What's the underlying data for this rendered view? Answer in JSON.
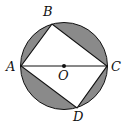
{
  "diagram": {
    "type": "geometry",
    "circle": {
      "center": [
        64,
        66
      ],
      "radius": 43.5
    },
    "points": {
      "A": {
        "label": "A",
        "pos": [
          21,
          66
        ],
        "label_pos": [
          6,
          71
        ]
      },
      "B": {
        "label": "B",
        "pos": [
          52,
          24
        ],
        "label_pos": [
          43,
          16
        ]
      },
      "C": {
        "label": "C",
        "pos": [
          107,
          66
        ],
        "label_pos": [
          111,
          71
        ]
      },
      "D": {
        "label": "D",
        "pos": [
          77,
          108
        ],
        "label_pos": [
          73,
          121
        ]
      },
      "O": {
        "label": "O",
        "pos": [
          64,
          66
        ],
        "label_pos": [
          58,
          79
        ]
      }
    },
    "segments": [
      "AB",
      "BC",
      "CD",
      "DA",
      "AC"
    ],
    "shaded_regions": [
      "segment-AB",
      "segment-BC",
      "segment-CD",
      "segment-DA"
    ],
    "colors": {
      "shade": "#8a8a8a",
      "stroke": "#111111",
      "background": "#ffffff"
    }
  }
}
